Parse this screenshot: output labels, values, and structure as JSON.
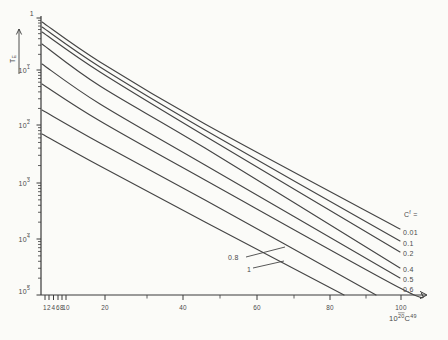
{
  "chart_data": {
    "type": "line",
    "title": "",
    "scale": {
      "y": "log",
      "y_range": [
        1e-05,
        1
      ],
      "x_ticks_shown": [
        1,
        2,
        4,
        6,
        8,
        10,
        20,
        40,
        60,
        80,
        100
      ]
    },
    "colors": {
      "ink": "#454545",
      "axis": "#3a3a3a",
      "text": "#4a4a4a",
      "bg": "#fbfbf8"
    },
    "y_axis": {
      "x_px": 41,
      "top_px": 16,
      "bottom_px": 295,
      "label_segments": [
        {
          "t": "T"
        },
        {
          "t": "E",
          "sub": true
        }
      ],
      "label_pos_px": [
        12,
        59
      ],
      "arrow": {
        "x": 19,
        "from_y": 74,
        "to_y": 29
      },
      "major_ticks": [
        {
          "segments": [
            {
              "t": "1"
            }
          ],
          "px": 18,
          "dx": 4,
          "dy": -4.5
        },
        {
          "segments": [
            {
              "t": "10"
            },
            {
              "t": "1",
              "sup": true,
              "bar": true
            }
          ],
          "px": 70
        },
        {
          "segments": [
            {
              "t": "10"
            },
            {
              "t": "2",
              "sup": true,
              "bar": true
            }
          ],
          "px": 125
        },
        {
          "segments": [
            {
              "t": "10"
            },
            {
              "t": "3",
              "sup": true,
              "bar": true
            }
          ],
          "px": 183
        },
        {
          "segments": [
            {
              "t": "10"
            },
            {
              "t": "4",
              "sup": true,
              "bar": true
            }
          ],
          "px": 239
        },
        {
          "segments": [
            {
              "t": "10"
            },
            {
              "t": "5",
              "sup": true,
              "bar": true
            }
          ],
          "px": 295,
          "dy": -4
        }
      ]
    },
    "x_axis": {
      "y_px": 295,
      "start_px": 41,
      "end_px": 420,
      "arrow_tip_px": 427,
      "unit_label_segments": [
        {
          "t": "10"
        },
        {
          "t": "20",
          "sup": true,
          "bar": true
        },
        {
          "t": "C"
        },
        {
          "t": "49",
          "sup": true
        }
      ],
      "unit_label_pos_px": [
        389,
        321
      ],
      "major_ticks": [
        {
          "label": "1",
          "px": 45
        },
        {
          "label": "2",
          "px": 49
        },
        {
          "label": "4",
          "px": 53.5
        },
        {
          "label": "6",
          "px": 58
        },
        {
          "label": "8",
          "px": 62
        },
        {
          "label": "10",
          "px": 66
        },
        {
          "label": "20",
          "px": 105
        },
        {
          "label": "40",
          "px": 183
        },
        {
          "label": "60",
          "px": 257
        },
        {
          "label": "80",
          "px": 330
        },
        {
          "label": "100",
          "px": 401
        }
      ],
      "minor_ticks_px": [
        147,
        220,
        294,
        366
      ]
    },
    "legend": {
      "title_segments": [
        {
          "t": "C"
        },
        {
          "t": "f",
          "sup": true
        },
        {
          "t": " ="
        }
      ],
      "title_pos_px": [
        404,
        217
      ],
      "items": [
        {
          "label": "0.01",
          "px": [
            403,
            235
          ]
        },
        {
          "label": "0.1",
          "px": [
            403,
            246
          ]
        },
        {
          "label": "0.2",
          "px": [
            403,
            256
          ]
        },
        {
          "label": "0.4",
          "px": [
            403,
            272
          ]
        },
        {
          "label": "0.5",
          "px": [
            403,
            282
          ]
        },
        {
          "label": "0.6",
          "px": [
            403,
            292
          ]
        }
      ]
    },
    "series": [
      {
        "name": "0.01",
        "points_px": [
          [
            42,
            22
          ],
          [
            100,
            62
          ],
          [
            205,
            124
          ],
          [
            400,
            229
          ]
        ],
        "approx_data": [
          [
            1,
            0.84
          ],
          [
            19,
            0.14
          ],
          [
            46,
            0.01
          ],
          [
            100,
            0.00015
          ]
        ]
      },
      {
        "name": "0.1",
        "points_px": [
          [
            42,
            27
          ],
          [
            100,
            67
          ],
          [
            205,
            130
          ],
          [
            400,
            241
          ]
        ],
        "approx_data": [
          [
            1,
            0.67
          ],
          [
            19,
            0.11
          ],
          [
            46,
            0.0082
          ],
          [
            100,
            9.2e-05
          ]
        ]
      },
      {
        "name": "0.2",
        "points_px": [
          [
            42,
            32
          ],
          [
            100,
            72
          ],
          [
            205,
            136
          ],
          [
            400,
            252
          ]
        ],
        "approx_data": [
          [
            1,
            0.54
          ],
          [
            19,
            0.092
          ],
          [
            46,
            0.0065
          ],
          [
            100,
            5.9e-05
          ]
        ]
      },
      {
        "name": "0.4",
        "points_px": [
          [
            42,
            44
          ],
          [
            100,
            86
          ],
          [
            205,
            148
          ],
          [
            400,
            268
          ]
        ],
        "approx_data": [
          [
            1,
            0.32
          ],
          [
            19,
            0.051
          ],
          [
            46,
            0.004
          ],
          [
            100,
            3e-05
          ]
        ]
      },
      {
        "name": "0.5",
        "points_px": [
          [
            42,
            64
          ],
          [
            100,
            104
          ],
          [
            205,
            165
          ],
          [
            400,
            278
          ]
        ],
        "approx_data": [
          [
            1,
            0.13
          ],
          [
            19,
            0.024
          ],
          [
            46,
            0.002
          ],
          [
            100,
            2e-05
          ]
        ]
      },
      {
        "name": "0.6",
        "points_px": [
          [
            42,
            84
          ],
          [
            100,
            121
          ],
          [
            205,
            180
          ],
          [
            400,
            288
          ],
          [
            422,
            293
          ]
        ],
        "approx_data": [
          [
            1,
            0.056
          ],
          [
            19,
            0.012
          ],
          [
            46,
            0.0011
          ],
          [
            100,
            1.3e-05
          ]
        ]
      },
      {
        "name": "0.8",
        "points_px": [
          [
            42,
            110
          ],
          [
            100,
            143
          ],
          [
            205,
            200
          ],
          [
            376,
            295
          ]
        ],
        "approx_data": [
          [
            1,
            0.019
          ],
          [
            19,
            0.0049
          ],
          [
            46,
            0.0005
          ],
          [
            92,
            1e-05
          ]
        ]
      },
      {
        "name": "1",
        "points_px": [
          [
            42,
            134
          ],
          [
            100,
            166
          ],
          [
            205,
            222
          ],
          [
            344,
            295
          ]
        ],
        "approx_data": [
          [
            1,
            0.007
          ],
          [
            19,
            0.002
          ],
          [
            46,
            0.0002
          ],
          [
            83,
            1e-05
          ]
        ]
      }
    ],
    "annotations": [
      {
        "label": "0.8",
        "text_px": [
          228,
          260
        ],
        "leader": [
          [
            246,
            257
          ],
          [
            285,
            247
          ]
        ]
      },
      {
        "label": "1",
        "text_px": [
          247,
          272
        ],
        "leader": [
          [
            253,
            268
          ],
          [
            284,
            261
          ]
        ]
      }
    ]
  }
}
